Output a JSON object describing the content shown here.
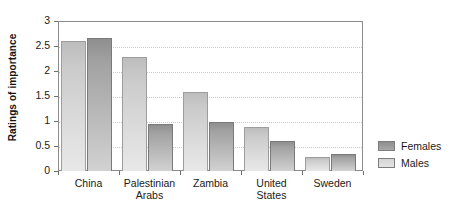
{
  "chart_data": {
    "type": "bar",
    "title": "",
    "xlabel": "",
    "ylabel": "Ratings of importance",
    "categories": [
      "China",
      "Palestinian Arabs",
      "Zambia",
      "United States",
      "Sweden"
    ],
    "category_lines": [
      [
        "China"
      ],
      [
        "Palestinian",
        "Arabs"
      ],
      [
        "Zambia"
      ],
      [
        "United",
        "States"
      ],
      [
        "Sweden"
      ]
    ],
    "series": [
      {
        "name": "Males",
        "values": [
          2.6,
          2.28,
          1.58,
          0.88,
          0.29
        ],
        "color": "#d6d6d6"
      },
      {
        "name": "Females",
        "values": [
          2.66,
          0.95,
          0.99,
          0.6,
          0.34
        ],
        "color": "#9a9a9a"
      }
    ],
    "bar_order": [
      "Males",
      "Females"
    ],
    "ylim": [
      0,
      3
    ],
    "yticks": [
      0,
      0.5,
      1,
      1.5,
      2,
      2.5,
      3
    ],
    "ytick_labels": [
      "0",
      "0.5",
      "1",
      "1.5",
      "2",
      "2.5",
      "3"
    ],
    "grid": true,
    "grid_axis": "y",
    "grid_style": "dotted",
    "legend_position": "right",
    "legend_entries": [
      "Females",
      "Males"
    ]
  },
  "axis": {
    "y_title": "Ratings of importance"
  },
  "legend": {
    "items": [
      {
        "label": "Females",
        "swatch": "females-swatch"
      },
      {
        "label": "Males",
        "swatch": "males-swatch"
      }
    ]
  }
}
